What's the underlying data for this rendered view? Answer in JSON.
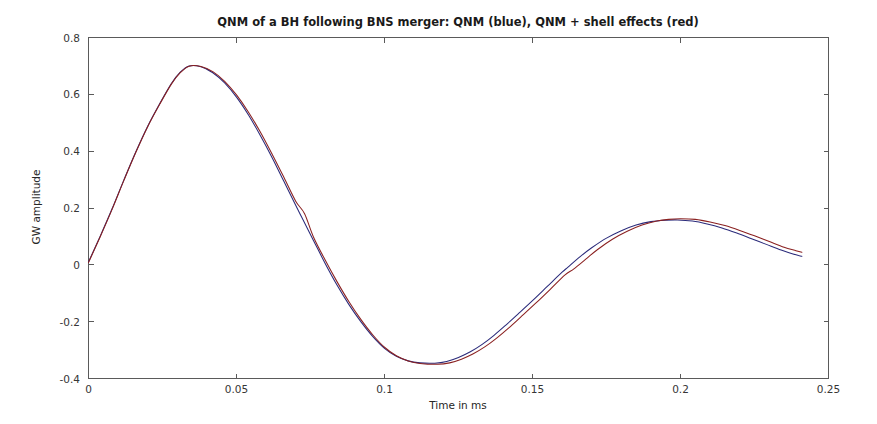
{
  "figure": {
    "background_color": "#ffffff",
    "axes_color": "#5a5a5a"
  },
  "chart_data": {
    "type": "line",
    "title": "QNM of a BH following BNS merger: QNM (blue), QNM + shell effects (red)",
    "xlabel": "Time in ms",
    "ylabel": "GW amplitude",
    "xlim": [
      0,
      0.25
    ],
    "ylim": [
      -0.4,
      0.8
    ],
    "xticks": [
      0,
      0.05,
      0.1,
      0.15,
      0.2,
      0.25
    ],
    "xtick_labels": [
      "0",
      "0.05",
      "0.1",
      "0.15",
      "0.2",
      "0.25"
    ],
    "yticks": [
      -0.4,
      -0.2,
      0,
      0.2,
      0.4,
      0.6,
      0.8
    ],
    "ytick_labels": [
      "-0.4",
      "-0.2",
      "0",
      "0.2",
      "0.4",
      "0.6",
      "0.8"
    ],
    "grid": false,
    "legend_position": "in-title",
    "annotations": [
      "First peak amplitude 0.70 at t = 0.034 ms",
      "Trough amplitude -0.345 at t = 0.117 ms",
      "Second peak amplitude 0.155 at t = 0.199 ms"
    ],
    "series": [
      {
        "name": "QNM",
        "color": "#2a2a7a",
        "legend_color_word": "blue",
        "x": [
          0.0,
          0.004,
          0.008,
          0.012,
          0.016,
          0.02,
          0.024,
          0.028,
          0.031,
          0.034,
          0.038,
          0.042,
          0.046,
          0.05,
          0.054,
          0.058,
          0.062,
          0.066,
          0.07,
          0.072,
          0.076,
          0.08,
          0.084,
          0.088,
          0.092,
          0.096,
          0.1,
          0.104,
          0.108,
          0.112,
          0.117,
          0.121,
          0.125,
          0.129,
          0.133,
          0.137,
          0.141,
          0.145,
          0.15,
          0.155,
          0.16,
          0.162,
          0.166,
          0.17,
          0.175,
          0.18,
          0.185,
          0.19,
          0.195,
          0.199,
          0.204,
          0.209,
          0.214,
          0.219,
          0.224,
          0.229,
          0.234,
          0.238,
          0.241
        ],
        "y": [
          0.01,
          0.102,
          0.198,
          0.3,
          0.398,
          0.488,
          0.566,
          0.638,
          0.678,
          0.7,
          0.697,
          0.676,
          0.64,
          0.59,
          0.528,
          0.456,
          0.378,
          0.294,
          0.21,
          0.168,
          0.086,
          0.004,
          -0.072,
          -0.14,
          -0.2,
          -0.252,
          -0.294,
          -0.322,
          -0.338,
          -0.345,
          -0.346,
          -0.34,
          -0.326,
          -0.306,
          -0.28,
          -0.248,
          -0.212,
          -0.174,
          -0.126,
          -0.076,
          -0.026,
          -0.008,
          0.028,
          0.06,
          0.094,
          0.12,
          0.14,
          0.152,
          0.157,
          0.158,
          0.154,
          0.144,
          0.13,
          0.112,
          0.092,
          0.072,
          0.052,
          0.038,
          0.03
        ]
      },
      {
        "name": "QNM + shell effects",
        "color": "#8a2020",
        "legend_color_word": "red",
        "x": [
          0.0,
          0.004,
          0.008,
          0.012,
          0.016,
          0.02,
          0.024,
          0.028,
          0.031,
          0.034,
          0.038,
          0.042,
          0.046,
          0.05,
          0.054,
          0.058,
          0.062,
          0.066,
          0.07,
          0.073,
          0.076,
          0.08,
          0.084,
          0.088,
          0.092,
          0.096,
          0.1,
          0.104,
          0.108,
          0.112,
          0.118,
          0.122,
          0.126,
          0.13,
          0.134,
          0.138,
          0.142,
          0.146,
          0.151,
          0.156,
          0.161,
          0.164,
          0.168,
          0.172,
          0.177,
          0.182,
          0.187,
          0.192,
          0.196,
          0.2,
          0.205,
          0.21,
          0.215,
          0.22,
          0.225,
          0.23,
          0.235,
          0.239,
          0.241
        ],
        "y": [
          0.008,
          0.1,
          0.196,
          0.298,
          0.396,
          0.486,
          0.564,
          0.636,
          0.676,
          0.699,
          0.698,
          0.68,
          0.646,
          0.598,
          0.538,
          0.468,
          0.39,
          0.308,
          0.224,
          0.18,
          0.098,
          0.016,
          -0.06,
          -0.13,
          -0.192,
          -0.246,
          -0.29,
          -0.32,
          -0.338,
          -0.347,
          -0.35,
          -0.345,
          -0.332,
          -0.313,
          -0.288,
          -0.257,
          -0.222,
          -0.184,
          -0.136,
          -0.086,
          -0.035,
          -0.014,
          0.02,
          0.054,
          0.09,
          0.118,
          0.14,
          0.154,
          0.16,
          0.162,
          0.16,
          0.151,
          0.138,
          0.121,
          0.102,
          0.082,
          0.062,
          0.05,
          0.044
        ]
      }
    ]
  }
}
